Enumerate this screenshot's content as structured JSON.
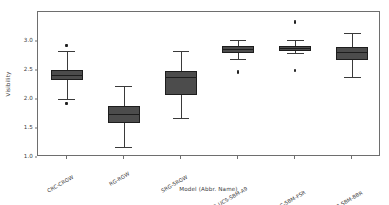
{
  "chart_data": {
    "type": "box",
    "title": "",
    "xlabel": "Model (Abbr. Name)",
    "ylabel": "Visibility",
    "ylim": [
      0.83,
      3.32
    ],
    "yticks": [
      "1.0",
      "1.5",
      "2.0",
      "2.5",
      "3.0"
    ],
    "ytick_values": [
      1.0,
      1.5,
      2.0,
      2.5,
      3.0
    ],
    "grid": false,
    "legend": "none",
    "box_color": "#4c4c4c",
    "edge_color": "#1d1d1d",
    "categories": [
      "CRC-CRGW",
      "RG-RGW",
      "SRG-SRGW",
      "CRI-E9-UCS-SBM-A9",
      "CRI-NRS-DRC-SBM-FSR",
      "CRI-NRS-DRC-SBM-BBR"
    ],
    "boxes": [
      {
        "name": "CRC-CRGW",
        "whisker_low": 1.83,
        "q1": 2.15,
        "median": 2.23,
        "q3": 2.33,
        "whisker_high": 2.65,
        "outliers": [
          1.74,
          1.76,
          2.74,
          2.76
        ]
      },
      {
        "name": "RG-RGW",
        "whisker_low": 1.01,
        "q1": 1.42,
        "median": 1.56,
        "q3": 1.71,
        "whisker_high": 2.05,
        "outliers": []
      },
      {
        "name": "SRG-SRGW",
        "whisker_low": 1.5,
        "q1": 1.9,
        "median": 2.2,
        "q3": 2.3,
        "whisker_high": 2.65,
        "outliers": []
      },
      {
        "name": "CRI-E9-UCS-SBM-A9",
        "whisker_low": 2.51,
        "q1": 2.62,
        "median": 2.68,
        "q3": 2.73,
        "whisker_high": 2.84,
        "outliers": [
          2.28,
          2.3
        ]
      },
      {
        "name": "CRI-NRS-DRC-SBM-FSR",
        "whisker_low": 2.62,
        "q1": 2.65,
        "median": 2.7,
        "q3": 2.74,
        "whisker_high": 2.84,
        "outliers": [
          2.3,
          2.32,
          3.14,
          3.17
        ]
      },
      {
        "name": "CRI-NRS-DRC-SBM-BBR",
        "whisker_low": 2.2,
        "q1": 2.5,
        "median": 2.62,
        "q3": 2.72,
        "whisker_high": 2.96,
        "outliers": []
      }
    ]
  }
}
